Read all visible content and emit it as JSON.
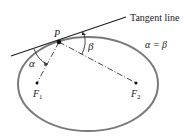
{
  "diagram": {
    "labels": {
      "tangent": "Tangent line",
      "point": "P",
      "alpha": "α",
      "beta": "β",
      "equation": "α = β",
      "focus1": "F",
      "focus1_sub": "1",
      "focus2": "F",
      "focus2_sub": "2"
    },
    "colors": {
      "ellipse": "#777777",
      "lines": "#222222",
      "text": "#222222"
    }
  }
}
